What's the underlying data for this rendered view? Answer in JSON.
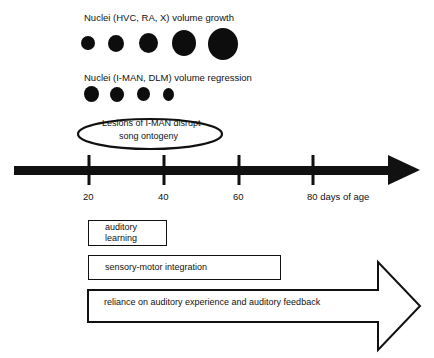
{
  "growth": {
    "label": "Nuclei (HVC, RA, X) volume growth",
    "dots": [
      {
        "cx": 88,
        "cy": 43,
        "rx": 7,
        "ry": 7
      },
      {
        "cx": 116,
        "cy": 43,
        "rx": 8,
        "ry": 8.5
      },
      {
        "cx": 148,
        "cy": 43,
        "rx": 9.5,
        "ry": 10
      },
      {
        "cx": 184,
        "cy": 43,
        "rx": 12,
        "ry": 13
      },
      {
        "cx": 223,
        "cy": 44,
        "rx": 15,
        "ry": 16
      }
    ]
  },
  "regression": {
    "label": "Nuclei (I-MAN, DLM) volume regression",
    "dots": [
      {
        "cx": 91,
        "cy": 94,
        "rx": 7.5,
        "ry": 8
      },
      {
        "cx": 117,
        "cy": 94,
        "rx": 7,
        "ry": 7.5
      },
      {
        "cx": 143,
        "cy": 94,
        "rx": 6.5,
        "ry": 7
      },
      {
        "cx": 168,
        "cy": 94,
        "rx": 5.5,
        "ry": 6.5
      }
    ]
  },
  "lesion_ellipse": {
    "line1": "Lesions of I-MAN disrupt",
    "line2": "song ontogeny"
  },
  "timeline": {
    "ticks": [
      {
        "x": 89,
        "label": "20"
      },
      {
        "x": 164,
        "label": "40"
      },
      {
        "x": 239,
        "label": "60"
      },
      {
        "x": 313,
        "label": "80 days of age"
      }
    ]
  },
  "phases": {
    "auditory_learning": {
      "line1": "auditory",
      "line2": "learning"
    },
    "sensory_motor": "sensory-motor integration",
    "reliance": "reliance on auditory experience and auditory feedback"
  }
}
